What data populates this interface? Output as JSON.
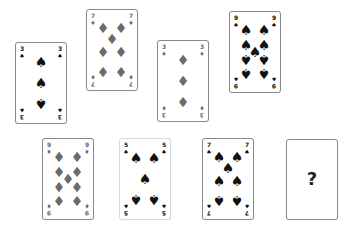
{
  "puzzle": {
    "cards": [
      {
        "id": "c1",
        "rank": "3",
        "suit": "spades",
        "symbol": "♠",
        "color": "#111111",
        "row": "top"
      },
      {
        "id": "c2",
        "rank": "7",
        "suit": "diamonds",
        "symbol": "♦",
        "color": "#6b6b6b",
        "row": "top"
      },
      {
        "id": "c3",
        "rank": "3",
        "suit": "diamonds",
        "symbol": "♦",
        "color": "#6b6b6b",
        "row": "top"
      },
      {
        "id": "c4",
        "rank": "9",
        "suit": "spades",
        "symbol": "♠",
        "color": "#111111",
        "row": "top"
      },
      {
        "id": "c5",
        "rank": "9",
        "suit": "diamonds",
        "symbol": "♦",
        "color": "#6b6b6b",
        "row": "bottom"
      },
      {
        "id": "c6",
        "rank": "5",
        "suit": "spades",
        "symbol": "♠",
        "color": "#111111",
        "row": "bottom"
      },
      {
        "id": "c7",
        "rank": "7",
        "suit": "spades",
        "symbol": "♠",
        "color": "#111111",
        "row": "bottom"
      }
    ],
    "unknown_card": {
      "label": "?"
    }
  }
}
